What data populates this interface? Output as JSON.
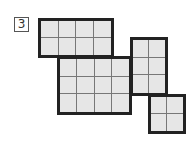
{
  "label": "3",
  "rects": [
    {
      "name": "top-left-rect",
      "x": 38,
      "y": 18,
      "w": 76,
      "h": 40,
      "cols": 4,
      "rows": 2
    },
    {
      "name": "center-rect",
      "x": 57,
      "y": 56,
      "w": 75,
      "h": 59,
      "cols": 4,
      "rows": 3
    },
    {
      "name": "right-rect",
      "x": 130,
      "y": 37,
      "w": 38,
      "h": 59,
      "cols": 2,
      "rows": 3
    },
    {
      "name": "bottom-right-rect",
      "x": 148,
      "y": 94,
      "w": 38,
      "h": 40,
      "cols": 2,
      "rows": 2
    }
  ],
  "colors": {
    "fill": "#e6e6e6",
    "border": "#222222",
    "gridline": "#777777"
  }
}
